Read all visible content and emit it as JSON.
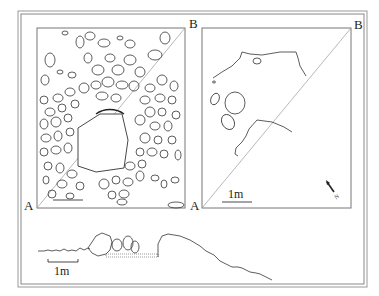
{
  "figure": {
    "type": "archaeological plan and section drawing",
    "colors": {
      "line": "#333333",
      "frame": "#888888",
      "background": "#ffffff"
    }
  },
  "plan_left": {
    "corner_labels": {
      "bottom_left": "A",
      "top_right": "B"
    },
    "description": "stone-by-stone plan of cairn with section line A–B",
    "scale_label": ""
  },
  "plan_right": {
    "corner_labels": {
      "bottom_left": "A",
      "top_right": "B"
    },
    "description": "outline plan of underlying features with section line A–B",
    "scale_label": "1m",
    "north_arrow": "N"
  },
  "section": {
    "description": "profile section along A–B",
    "scale_label": "1m"
  }
}
